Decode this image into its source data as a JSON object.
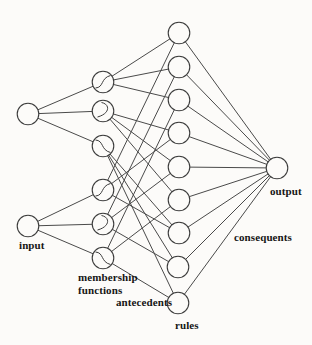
{
  "diagram": {
    "type": "neuro-fuzzy-network",
    "layer_order": [
      "input",
      "membership functions",
      "antecedents",
      "rules",
      "consequents",
      "output"
    ]
  },
  "labels": {
    "input": "input",
    "membership_line1": "membership",
    "membership_line2": "functions",
    "antecedents": "antecedents",
    "rules": "rules",
    "output": "output",
    "consequents": "consequents"
  },
  "style": {
    "background": "#fcfbf9",
    "edge_color": "#4a4a4a",
    "node_stroke_color": "#3c3c3c",
    "node_fill_color": "#fcfbf9",
    "text_color": "#151515",
    "node_radius": 10.8,
    "edge_width": 1,
    "node_stroke_width": 1.1
  },
  "nodes": [
    {
      "id": "input-1",
      "layer": "input",
      "x": 28,
      "y": 114
    },
    {
      "id": "input-2",
      "layer": "input",
      "x": 28,
      "y": 226
    },
    {
      "id": "mf-1",
      "layer": "membership",
      "x": 103,
      "y": 82,
      "glyph": "sigmoid-rising"
    },
    {
      "id": "mf-2",
      "layer": "membership",
      "x": 103,
      "y": 111,
      "glyph": "arc-right"
    },
    {
      "id": "mf-3",
      "layer": "membership",
      "x": 103,
      "y": 146,
      "glyph": "sigmoid-falling"
    },
    {
      "id": "mf-4",
      "layer": "membership",
      "x": 103,
      "y": 190,
      "glyph": "sigmoid-rising"
    },
    {
      "id": "mf-5",
      "layer": "membership",
      "x": 103,
      "y": 224,
      "glyph": "arc-right"
    },
    {
      "id": "mf-6",
      "layer": "membership",
      "x": 103,
      "y": 258,
      "glyph": "sigmoid-falling"
    },
    {
      "id": "rule-1",
      "layer": "rules",
      "x": 179,
      "y": 33
    },
    {
      "id": "rule-2",
      "layer": "rules",
      "x": 179,
      "y": 67
    },
    {
      "id": "rule-3",
      "layer": "rules",
      "x": 179,
      "y": 100
    },
    {
      "id": "rule-4",
      "layer": "rules",
      "x": 179,
      "y": 133
    },
    {
      "id": "rule-5",
      "layer": "rules",
      "x": 179,
      "y": 167
    },
    {
      "id": "rule-6",
      "layer": "rules",
      "x": 179,
      "y": 200
    },
    {
      "id": "rule-7",
      "layer": "rules",
      "x": 179,
      "y": 233
    },
    {
      "id": "rule-8",
      "layer": "rules",
      "x": 178,
      "y": 267
    },
    {
      "id": "rule-9",
      "layer": "rules",
      "x": 178,
      "y": 303
    },
    {
      "id": "output-1",
      "layer": "output",
      "x": 277,
      "y": 168
    }
  ],
  "edges": [
    [
      "input-1",
      "mf-1"
    ],
    [
      "input-1",
      "mf-2"
    ],
    [
      "input-1",
      "mf-3"
    ],
    [
      "input-2",
      "mf-4"
    ],
    [
      "input-2",
      "mf-5"
    ],
    [
      "input-2",
      "mf-6"
    ],
    [
      "mf-1",
      "rule-1"
    ],
    [
      "mf-1",
      "rule-2"
    ],
    [
      "mf-1",
      "rule-3"
    ],
    [
      "mf-2",
      "rule-4"
    ],
    [
      "mf-2",
      "rule-5"
    ],
    [
      "mf-2",
      "rule-6"
    ],
    [
      "mf-3",
      "rule-7"
    ],
    [
      "mf-3",
      "rule-8"
    ],
    [
      "mf-3",
      "rule-9"
    ],
    [
      "mf-4",
      "rule-1"
    ],
    [
      "mf-4",
      "rule-4"
    ],
    [
      "mf-4",
      "rule-7"
    ],
    [
      "mf-5",
      "rule-2"
    ],
    [
      "mf-5",
      "rule-5"
    ],
    [
      "mf-5",
      "rule-8"
    ],
    [
      "mf-6",
      "rule-3"
    ],
    [
      "mf-6",
      "rule-6"
    ],
    [
      "mf-6",
      "rule-9"
    ],
    [
      "rule-1",
      "output-1"
    ],
    [
      "rule-2",
      "output-1"
    ],
    [
      "rule-3",
      "output-1"
    ],
    [
      "rule-4",
      "output-1"
    ],
    [
      "rule-5",
      "output-1"
    ],
    [
      "rule-6",
      "output-1"
    ],
    [
      "rule-7",
      "output-1"
    ],
    [
      "rule-8",
      "output-1"
    ],
    [
      "rule-9",
      "output-1"
    ]
  ],
  "glyph_paths": {
    "sigmoid-rising": "M -7.5 6 C 1 5.5, -2.5 -4, 7.5 -6.5",
    "arc-right": "M -1.5 -8.5 C 7 -7, 7.5 2.5, -5.5 6",
    "sigmoid-falling": "M -7.5 -6 C 1 -5.5, -2.5 4, 7.5 6.5"
  }
}
